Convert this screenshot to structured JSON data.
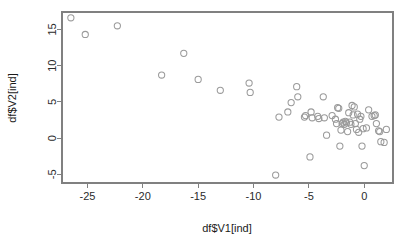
{
  "chart_data": {
    "type": "scatter",
    "title": "",
    "xlabel": "df$V1[ind]",
    "ylabel": "df$V2[ind]",
    "xlim": [
      -27.3,
      2.6
    ],
    "ylim": [
      -6.2,
      17.4
    ],
    "grid": false,
    "legend": null,
    "marker": {
      "shape": "open-circle",
      "radius_px": 3.1,
      "stroke_color": "#9a9a9a"
    },
    "frame_color": "#808080",
    "background_color": "#ffffff",
    "xticks": [
      -25,
      -20,
      -15,
      -10,
      -5,
      0
    ],
    "xtick_labels": [
      "-25",
      "-20",
      "-15",
      "-10",
      "-5",
      "0"
    ],
    "yticks": [
      -5,
      0,
      5,
      10,
      15
    ],
    "ytick_labels": [
      "-5",
      "0",
      "5",
      "10",
      "15"
    ],
    "n_points": 62,
    "points": [
      [
        -26.5,
        16.6
      ],
      [
        -25.2,
        14.3
      ],
      [
        -22.3,
        15.5
      ],
      [
        -18.3,
        8.7
      ],
      [
        -16.3,
        11.7
      ],
      [
        -15.0,
        8.1
      ],
      [
        -13.0,
        6.6
      ],
      [
        -10.4,
        7.6
      ],
      [
        -10.3,
        6.3
      ],
      [
        -8.0,
        -5.1
      ],
      [
        -7.7,
        2.9
      ],
      [
        -6.9,
        3.6
      ],
      [
        -6.6,
        4.9
      ],
      [
        -6.1,
        7.1
      ],
      [
        -6.0,
        5.7
      ],
      [
        -5.4,
        2.9
      ],
      [
        -5.3,
        3.1
      ],
      [
        -4.9,
        -2.6
      ],
      [
        -4.8,
        3.6
      ],
      [
        -4.7,
        2.8
      ],
      [
        -4.2,
        3.0
      ],
      [
        -4.1,
        2.7
      ],
      [
        -3.7,
        5.7
      ],
      [
        -3.6,
        2.8
      ],
      [
        -3.4,
        0.4
      ],
      [
        -2.9,
        3.1
      ],
      [
        -2.6,
        2.6
      ],
      [
        -2.5,
        2.0
      ],
      [
        -2.4,
        4.2
      ],
      [
        -2.3,
        4.1
      ],
      [
        -2.2,
        -1.1
      ],
      [
        -2.1,
        1.1
      ],
      [
        -2.0,
        2.0
      ],
      [
        -1.9,
        2.2
      ],
      [
        -1.8,
        1.9
      ],
      [
        -1.7,
        2.3
      ],
      [
        -1.6,
        2.1
      ],
      [
        -1.5,
        0.9
      ],
      [
        -1.4,
        3.5
      ],
      [
        -1.3,
        2.2
      ],
      [
        -1.2,
        1.9
      ],
      [
        -1.1,
        4.5
      ],
      [
        -1.0,
        3.2
      ],
      [
        -0.9,
        4.3
      ],
      [
        -0.8,
        2.0
      ],
      [
        -0.7,
        1.2
      ],
      [
        -0.6,
        3.3
      ],
      [
        -0.5,
        0.8
      ],
      [
        -0.4,
        2.6
      ],
      [
        -0.3,
        3.0
      ],
      [
        -0.2,
        -1.1
      ],
      [
        -0.1,
        1.3
      ],
      [
        0.0,
        -3.8
      ],
      [
        0.2,
        1.4
      ],
      [
        0.4,
        3.9
      ],
      [
        0.7,
        3.0
      ],
      [
        0.9,
        3.1
      ],
      [
        1.0,
        3.2
      ],
      [
        1.1,
        2.0
      ],
      [
        1.3,
        1.0
      ],
      [
        1.4,
        0.9
      ],
      [
        1.5,
        -0.5
      ],
      [
        1.8,
        -0.6
      ],
      [
        2.0,
        1.2
      ]
    ]
  },
  "layout": {
    "plot_left_px": 62,
    "plot_right_px": 393,
    "plot_top_px": 12,
    "plot_bottom_px": 183
  }
}
